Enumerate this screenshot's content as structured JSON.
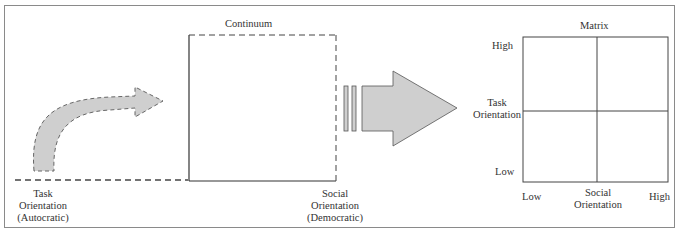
{
  "diagram": {
    "continuum": {
      "title": "Continuum",
      "left_label": [
        "Task",
        "Orientation",
        "(Autocratic)"
      ],
      "right_label": [
        "Social",
        "Orientation",
        "(Democratic)"
      ]
    },
    "matrix": {
      "title": "Matrix",
      "y_axis": {
        "high": "High",
        "label": [
          "Task",
          "Orientation"
        ],
        "low": "Low"
      },
      "x_axis": {
        "low": "Low",
        "label": [
          "Social",
          "Orientation"
        ],
        "high": "High"
      }
    },
    "colors": {
      "arrow_fill": "#cfcfcf",
      "line": "#444444",
      "frame": "#8a8a8a"
    }
  }
}
